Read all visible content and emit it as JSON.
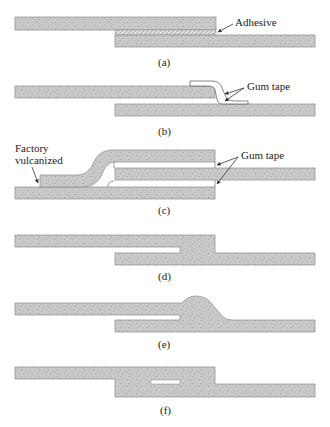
{
  "diagram": {
    "colors": {
      "belt_fill": "#c9c9c9",
      "belt_stroke": "#8a8a8a",
      "speckle": "#9a9a9a",
      "tape_stroke": "#555555",
      "text": "#222222"
    },
    "panels": [
      {
        "id": "a",
        "caption": "(a)",
        "annotations": [
          {
            "label": "Adhesive"
          }
        ]
      },
      {
        "id": "b",
        "caption": "(b)",
        "annotations": [
          {
            "label": "Gum tape"
          }
        ]
      },
      {
        "id": "c",
        "caption": "(c)",
        "annotations": [
          {
            "label": "Factory\nvulcanized",
            "line1": "Factory",
            "line2": "vulcanized"
          },
          {
            "label": "Gum tape"
          }
        ]
      },
      {
        "id": "d",
        "caption": "(d)",
        "annotations": []
      },
      {
        "id": "e",
        "caption": "(e)",
        "annotations": []
      },
      {
        "id": "f",
        "caption": "(f)",
        "annotations": []
      }
    ]
  }
}
